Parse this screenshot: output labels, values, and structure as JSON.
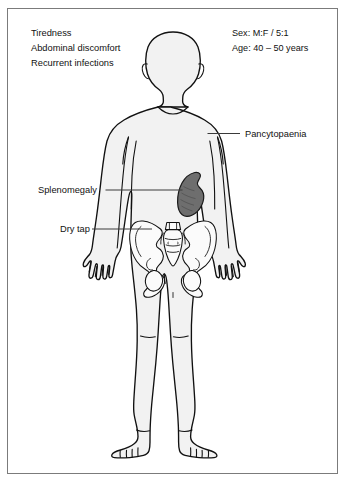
{
  "figure": {
    "border_color": "#7b7b7b",
    "body_fill": "#f2f2f2",
    "body_stroke": "#111111",
    "spleen_color": "#6e6e6e",
    "leader_color": "#3a3a3a"
  },
  "symptoms": {
    "items": [
      {
        "label": "Tiredness"
      },
      {
        "label": "Abdominal discomfort"
      },
      {
        "label": "Recurrent infections"
      }
    ]
  },
  "demographics": {
    "items": [
      {
        "label": "Sex: M:F / 5:1"
      },
      {
        "label": "Age: 40 – 50 years"
      }
    ]
  },
  "annotations": {
    "pancytopaenia": {
      "label": "Pancytopaenia"
    },
    "splenomegaly": {
      "label": "Splenomegaly"
    },
    "dry_tap": {
      "label": "Dry tap"
    }
  },
  "anatomy": {
    "figure_name": "human-body-anterior",
    "organs": [
      {
        "name": "spleen",
        "state": "enlarged"
      },
      {
        "name": "pelvis",
        "state": "normal"
      }
    ]
  }
}
